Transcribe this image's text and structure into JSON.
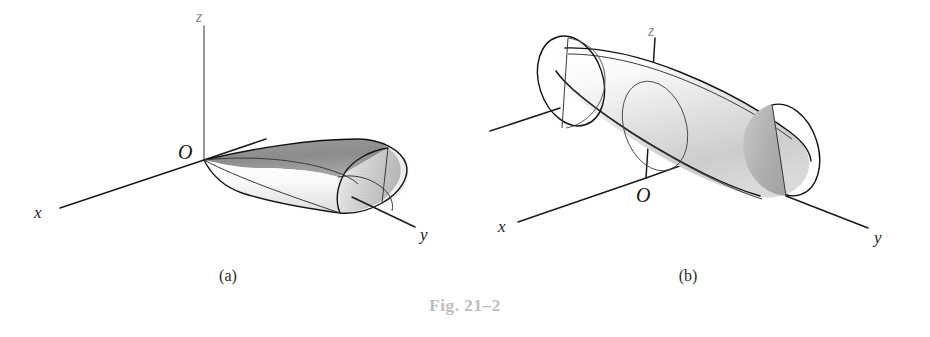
{
  "figure": {
    "caption": "Fig. 21–2",
    "caption_color": "#bdbdbd",
    "background_color": "#ffffff"
  },
  "panels": [
    {
      "id": "a",
      "sub_caption": "(a)",
      "solid_name": "half-cylinder",
      "axes": {
        "x_label": "x",
        "y_label": "y",
        "z_label": "z",
        "origin_label": "O"
      },
      "shading": {
        "top_surface": "#8f8f8f",
        "front_surface": "#f0f0f0",
        "end_cap": "#d6d6d6",
        "outline": "#121212"
      }
    },
    {
      "id": "b",
      "sub_caption": "(b)",
      "solid_name": "full-cylinder",
      "axes": {
        "x_label": "x",
        "y_label": "y",
        "z_label": "z",
        "origin_label": "O"
      },
      "shading": {
        "body_light": "#fbfbfb",
        "body_mid": "#d9d9d9",
        "near_cap_dark": "#b2b2b2",
        "near_cap_light": "#ebebeb",
        "far_cap": "#fcfcfc",
        "outline": "#121212"
      }
    }
  ]
}
